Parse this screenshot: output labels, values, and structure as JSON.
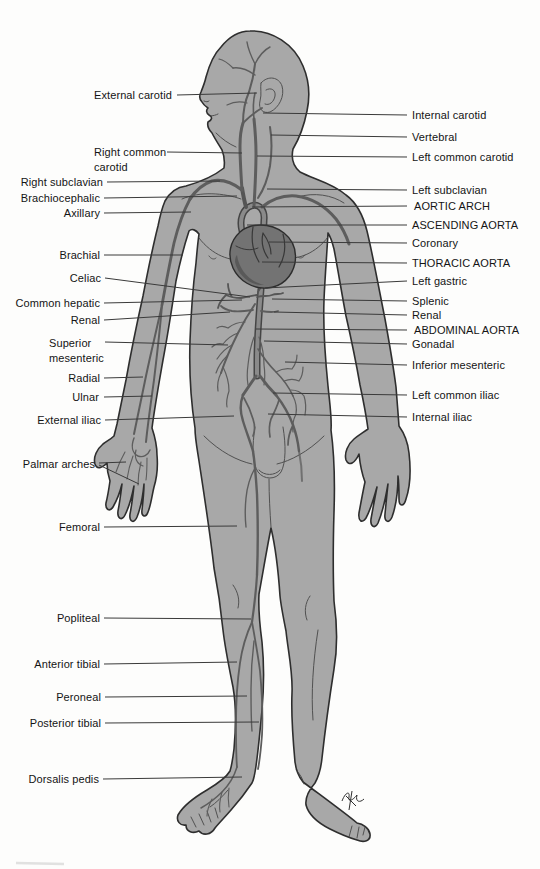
{
  "figure": {
    "colors": {
      "background": "#fdfdfc",
      "body_fill": "#a8a8a8",
      "body_outline": "#2e2e2e",
      "detail_line": "#3c3c3c",
      "artery": "#5d5d5d",
      "aorta_core": "#8a8a8a",
      "aorta_edge": "#454545",
      "heart_fill": "#737373",
      "leader_line": "#3a3a3a",
      "label_text": "#141414"
    },
    "labels": {
      "left": [
        {
          "id": "external-carotid",
          "text": "External carotid",
          "anchor": "right",
          "x": 172,
          "y": 95,
          "leaders": [
            [
              177,
              95,
              257,
              93
            ]
          ]
        },
        {
          "id": "right-common-carotid",
          "text": "Right common\ncarotid",
          "anchor": "left",
          "x": 94,
          "y": 152,
          "leaders": [
            [
              167,
              152,
              242,
              153
            ]
          ]
        },
        {
          "id": "right-subclavian",
          "text": "Right subclavian",
          "anchor": "right",
          "x": 103,
          "y": 182,
          "leaders": [
            [
              107,
              182,
              220,
              181
            ]
          ]
        },
        {
          "id": "brachiocephalic",
          "text": "Brachiocephalic",
          "anchor": "right",
          "x": 100,
          "y": 198,
          "leaders": [
            [
              104,
              198,
              237,
              196
            ]
          ]
        },
        {
          "id": "axillary",
          "text": "Axillary",
          "anchor": "right",
          "x": 100,
          "y": 213,
          "leaders": [
            [
              104,
              213,
              191,
              212
            ]
          ]
        },
        {
          "id": "brachial",
          "text": "Brachial",
          "anchor": "right",
          "x": 100,
          "y": 255,
          "leaders": [
            [
              104,
              255,
              183,
              255
            ]
          ]
        },
        {
          "id": "celiac",
          "text": "Celiac",
          "anchor": "right",
          "x": 101,
          "y": 278,
          "leaders": [
            [
              105,
              278,
              250,
              297
            ]
          ]
        },
        {
          "id": "common-hepatic",
          "text": "Common hepatic",
          "anchor": "right",
          "x": 100,
          "y": 303,
          "leaders": [
            [
              104,
              303,
              242,
              300
            ]
          ]
        },
        {
          "id": "renal-left",
          "text": "Renal",
          "anchor": "right",
          "x": 100,
          "y": 320,
          "leaders": [
            [
              104,
              320,
              230,
              312
            ]
          ]
        },
        {
          "id": "superior-mesenteric",
          "text": "Superior\nmesenteric",
          "anchor": "left",
          "x": 49,
          "y": 343,
          "leaders": [
            [
              105,
              342,
              228,
              345
            ]
          ]
        },
        {
          "id": "radial",
          "text": "Radial",
          "anchor": "right",
          "x": 100,
          "y": 378,
          "leaders": [
            [
              104,
              378,
              143,
              377
            ]
          ]
        },
        {
          "id": "ulnar",
          "text": "Ulnar",
          "anchor": "right",
          "x": 99,
          "y": 397,
          "leaders": [
            [
              104,
              397,
              152,
              396
            ]
          ]
        },
        {
          "id": "external-iliac",
          "text": "External iliac",
          "anchor": "right",
          "x": 101,
          "y": 420,
          "leaders": [
            [
              105,
              420,
              234,
              416
            ]
          ]
        },
        {
          "id": "palmar-arches",
          "text": "Palmar arches",
          "anchor": "right",
          "x": 95,
          "y": 464,
          "leaders": [
            [
              99,
              463,
              126,
              462
            ],
            [
              99,
              465,
              139,
              484
            ]
          ]
        },
        {
          "id": "femoral",
          "text": "Femoral",
          "anchor": "right",
          "x": 100,
          "y": 527,
          "leaders": [
            [
              104,
              527,
              237,
              526
            ]
          ]
        },
        {
          "id": "popliteal",
          "text": "Popliteal",
          "anchor": "right",
          "x": 100,
          "y": 618,
          "leaders": [
            [
              104,
              618,
              251,
              619
            ]
          ]
        },
        {
          "id": "anterior-tibial",
          "text": "Anterior tibial",
          "anchor": "right",
          "x": 100,
          "y": 664,
          "leaders": [
            [
              104,
              664,
              237,
              662
            ]
          ]
        },
        {
          "id": "peroneal",
          "text": "Peroneal",
          "anchor": "right",
          "x": 101,
          "y": 697,
          "leaders": [
            [
              105,
              697,
              247,
              696
            ]
          ]
        },
        {
          "id": "posterior-tibial",
          "text": "Posterior tibial",
          "anchor": "right",
          "x": 101,
          "y": 723,
          "leaders": [
            [
              105,
              723,
              259,
              722
            ]
          ]
        },
        {
          "id": "dorsalis-pedis",
          "text": "Dorsalis pedis",
          "anchor": "right",
          "x": 99,
          "y": 779,
          "leaders": [
            [
              103,
              779,
              242,
              777
            ]
          ]
        }
      ],
      "right": [
        {
          "id": "internal-carotid",
          "text": "Internal carotid",
          "anchor": "left",
          "x": 412,
          "y": 115,
          "leaders": [
            [
              407,
              115,
              263,
              113
            ]
          ]
        },
        {
          "id": "vertebral",
          "text": "Vertebral",
          "anchor": "left",
          "x": 412,
          "y": 137,
          "leaders": [
            [
              407,
              137,
              271,
              135
            ]
          ]
        },
        {
          "id": "left-common-carotid",
          "text": "Left common carotid",
          "anchor": "left",
          "x": 412,
          "y": 157,
          "leaders": [
            [
              407,
              157,
              257,
              156
            ]
          ]
        },
        {
          "id": "left-subclavian",
          "text": "Left subclavian",
          "anchor": "left",
          "x": 412,
          "y": 190,
          "leaders": [
            [
              407,
              190,
              267,
              189
            ]
          ]
        },
        {
          "id": "aortic-arch",
          "text": "AORTIC ARCH",
          "anchor": "left",
          "x": 414,
          "y": 206,
          "leaders": [
            [
              407,
              206,
              252,
              207
            ]
          ]
        },
        {
          "id": "ascending-aorta",
          "text": "ASCENDING AORTA",
          "anchor": "left",
          "x": 412,
          "y": 225,
          "leaders": [
            [
              407,
              225,
              247,
              225
            ]
          ]
        },
        {
          "id": "coronary",
          "text": "Coronary",
          "anchor": "left",
          "x": 412,
          "y": 243,
          "leaders": [
            [
              407,
              243,
              269,
              242
            ]
          ]
        },
        {
          "id": "thoracic-aorta",
          "text": "THORACIC AORTA",
          "anchor": "left",
          "x": 412,
          "y": 263,
          "leaders": [
            [
              407,
              263,
              262,
              262
            ]
          ]
        },
        {
          "id": "left-gastric",
          "text": "Left gastric",
          "anchor": "left",
          "x": 412,
          "y": 281,
          "leaders": [
            [
              407,
              281,
              265,
              288
            ]
          ]
        },
        {
          "id": "splenic",
          "text": "Splenic",
          "anchor": "left",
          "x": 412,
          "y": 301,
          "leaders": [
            [
              407,
              301,
              272,
              299
            ]
          ]
        },
        {
          "id": "renal-right",
          "text": "Renal",
          "anchor": "left",
          "x": 412,
          "y": 315,
          "leaders": [
            [
              407,
              315,
              274,
              312
            ]
          ]
        },
        {
          "id": "abdominal-aorta",
          "text": "ABDOMINAL AORTA",
          "anchor": "left",
          "x": 414,
          "y": 330,
          "leaders": [
            [
              407,
              330,
              256,
              329
            ]
          ]
        },
        {
          "id": "gonadal",
          "text": "Gonadal",
          "anchor": "left",
          "x": 412,
          "y": 344,
          "leaders": [
            [
              407,
              344,
              264,
              341
            ]
          ]
        },
        {
          "id": "inferior-mesenteric",
          "text": "Inferior mesenteric",
          "anchor": "left",
          "x": 412,
          "y": 365,
          "leaders": [
            [
              407,
              365,
              285,
              362
            ]
          ]
        },
        {
          "id": "left-common-iliac",
          "text": "Left common iliac",
          "anchor": "left",
          "x": 412,
          "y": 395,
          "leaders": [
            [
              407,
              395,
              273,
              393
            ]
          ]
        },
        {
          "id": "internal-iliac",
          "text": "Internal iliac",
          "anchor": "left",
          "x": 412,
          "y": 417,
          "leaders": [
            [
              407,
              417,
              268,
              414
            ]
          ]
        }
      ]
    }
  }
}
